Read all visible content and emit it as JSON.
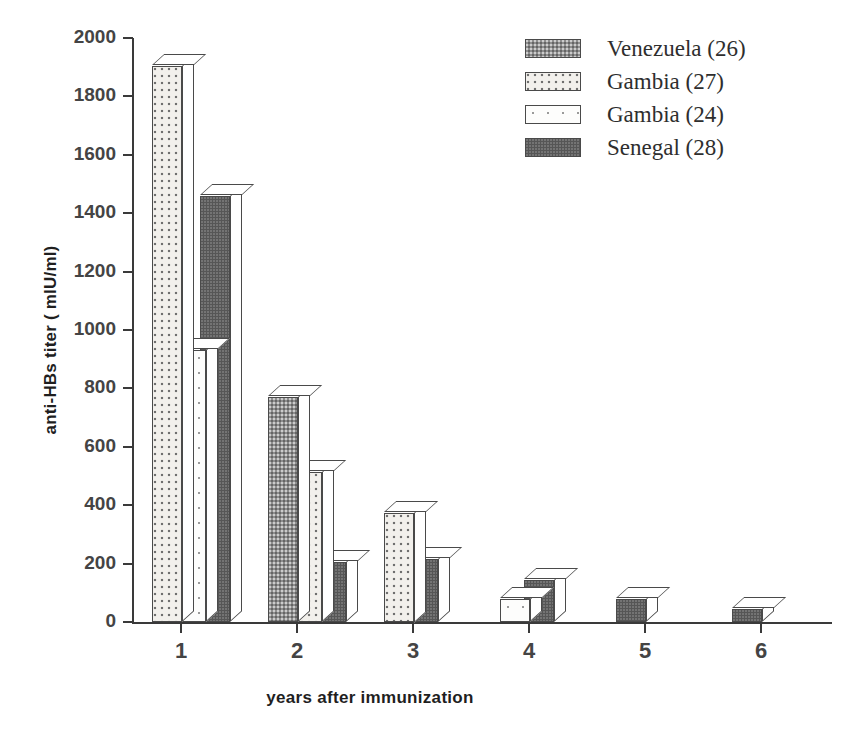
{
  "chart_data": {
    "type": "bar",
    "title": "",
    "xlabel": "years after immunization",
    "ylabel": "anti-HBs titer ( mIU/ml)",
    "categories": [
      "1",
      "2",
      "3",
      "4",
      "5",
      "6"
    ],
    "ylim": [
      0,
      2000
    ],
    "yticks": [
      0,
      200,
      400,
      600,
      800,
      1000,
      1200,
      1400,
      1600,
      1800,
      2000
    ],
    "grid": false,
    "legend_position": "top-right",
    "series": [
      {
        "name": "Venezuela (26)",
        "fill": "venezuela",
        "color": "#8e8e8e",
        "values": [
          null,
          770,
          null,
          null,
          null,
          null
        ]
      },
      {
        "name": "Gambia (27)",
        "fill": "gambia27",
        "color": "#f2f0ec",
        "values": [
          1905,
          515,
          375,
          null,
          null,
          null
        ]
      },
      {
        "name": "Gambia (24)",
        "fill": "gambia24",
        "color": "#fdfdfc",
        "values": [
          930,
          null,
          null,
          80,
          null,
          null
        ]
      },
      {
        "name": "Senegal (28)",
        "fill": "senegal",
        "color": "#565656",
        "values": [
          1460,
          205,
          215,
          145,
          80,
          45
        ]
      }
    ]
  },
  "legend": {
    "items": [
      {
        "label": "Venezuela (26)",
        "fill": "venezuela"
      },
      {
        "label": "Gambia (27)",
        "fill": "gambia27"
      },
      {
        "label": "Gambia (24)",
        "fill": "gambia24"
      },
      {
        "label": "Senegal (28)",
        "fill": "senegal"
      }
    ]
  },
  "axes": {
    "y_title": "anti-HBs titer ( mIU/ml)",
    "x_title": "years after immunization",
    "y_tick_labels": [
      "2000",
      "1800",
      "1600",
      "1400",
      "1200",
      "1000",
      "800",
      "600",
      "400",
      "200",
      "0"
    ],
    "x_tick_labels": [
      "1",
      "2",
      "3",
      "4",
      "5",
      "6"
    ]
  }
}
